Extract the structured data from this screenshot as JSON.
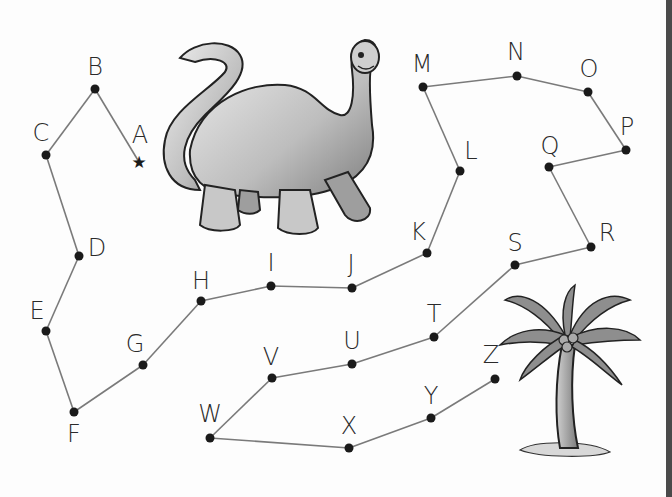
{
  "worksheet": {
    "type": "connect-the-dots",
    "sequence": "A-Z",
    "line_color": "#7a7a7a",
    "dot_color": "#1a1a1a",
    "start_marker": "star-icon",
    "points": [
      {
        "label": "A",
        "x": 139,
        "y": 162,
        "lx": 140,
        "ly": 143,
        "marker": "star"
      },
      {
        "label": "B",
        "x": 95,
        "y": 89,
        "lx": 95,
        "ly": 75
      },
      {
        "label": "C",
        "x": 46,
        "y": 155,
        "lx": 41,
        "ly": 141
      },
      {
        "label": "D",
        "x": 79,
        "y": 256,
        "lx": 97,
        "ly": 256
      },
      {
        "label": "E",
        "x": 46,
        "y": 331,
        "lx": 37,
        "ly": 319
      },
      {
        "label": "F",
        "x": 74,
        "y": 412,
        "lx": 74,
        "ly": 442
      },
      {
        "label": "G",
        "x": 143,
        "y": 365,
        "lx": 135,
        "ly": 352
      },
      {
        "label": "H",
        "x": 201,
        "y": 301,
        "lx": 201,
        "ly": 289
      },
      {
        "label": "I",
        "x": 271,
        "y": 286,
        "lx": 271,
        "ly": 271
      },
      {
        "label": "J",
        "x": 352,
        "y": 288,
        "lx": 351,
        "ly": 272
      },
      {
        "label": "K",
        "x": 427,
        "y": 253,
        "lx": 418,
        "ly": 240
      },
      {
        "label": "L",
        "x": 460,
        "y": 171,
        "lx": 471,
        "ly": 159
      },
      {
        "label": "M",
        "x": 423,
        "y": 87,
        "lx": 422,
        "ly": 72
      },
      {
        "label": "N",
        "x": 517,
        "y": 76,
        "lx": 516,
        "ly": 60
      },
      {
        "label": "O",
        "x": 588,
        "y": 92,
        "lx": 589,
        "ly": 77
      },
      {
        "label": "P",
        "x": 626,
        "y": 150,
        "lx": 627,
        "ly": 135
      },
      {
        "label": "Q",
        "x": 549,
        "y": 167,
        "lx": 550,
        "ly": 154
      },
      {
        "label": "R",
        "x": 591,
        "y": 247,
        "lx": 607,
        "ly": 241
      },
      {
        "label": "S",
        "x": 515,
        "y": 265,
        "lx": 515,
        "ly": 251
      },
      {
        "label": "T",
        "x": 434,
        "y": 337,
        "lx": 434,
        "ly": 322
      },
      {
        "label": "U",
        "x": 352,
        "y": 364,
        "lx": 352,
        "ly": 349
      },
      {
        "label": "V",
        "x": 272,
        "y": 378,
        "lx": 271,
        "ly": 365
      },
      {
        "label": "W",
        "x": 210,
        "y": 438,
        "lx": 210,
        "ly": 422
      },
      {
        "label": "X",
        "x": 349,
        "y": 448,
        "lx": 349,
        "ly": 434
      },
      {
        "label": "Y",
        "x": 431,
        "y": 418,
        "lx": 431,
        "ly": 404
      },
      {
        "label": "Z",
        "x": 495,
        "y": 379,
        "lx": 491,
        "ly": 363
      }
    ],
    "illustrations": [
      {
        "name": "dinosaur-illustration",
        "description": "smiling long-necked dinosaur"
      },
      {
        "name": "palm-tree-illustration",
        "description": "palm tree with coconuts on a small mound"
      }
    ]
  }
}
